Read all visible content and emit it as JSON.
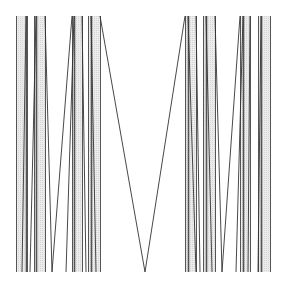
{
  "figure": {
    "width": 284,
    "height": 286,
    "background": "#ffffff",
    "stripe_fill": "#e4e4e4",
    "edge_color": "#555555",
    "line_color": "#333333",
    "top": 16,
    "bottom": 272,
    "stripes": [
      {
        "x": 16,
        "w": 10
      },
      {
        "x": 34,
        "w": 11
      },
      {
        "x": 72,
        "w": 10
      },
      {
        "x": 88,
        "w": 12
      },
      {
        "x": 185,
        "w": 11
      },
      {
        "x": 203,
        "w": 12
      },
      {
        "x": 240,
        "w": 10
      },
      {
        "x": 258,
        "w": 12
      }
    ],
    "edges": [
      16,
      26,
      27,
      34,
      36,
      45,
      72,
      74,
      82,
      88,
      91,
      100,
      185,
      188,
      196,
      203,
      206,
      215,
      240,
      243,
      250,
      258,
      261,
      270
    ],
    "zigzags": [
      [
        [
          26,
          16
        ],
        [
          22,
          272
        ]
      ],
      [
        [
          36,
          16
        ],
        [
          30,
          272
        ]
      ],
      [
        [
          45,
          16
        ],
        [
          52,
          272
        ]
      ],
      [
        [
          52,
          272
        ],
        [
          72,
          16
        ]
      ],
      [
        [
          66,
          272
        ],
        [
          74,
          16
        ]
      ],
      [
        [
          82,
          16
        ],
        [
          86,
          272
        ]
      ],
      [
        [
          91,
          16
        ],
        [
          96,
          272
        ]
      ],
      [
        [
          100,
          16
        ],
        [
          145,
          272
        ]
      ],
      [
        [
          145,
          272
        ],
        [
          185,
          16
        ]
      ],
      [
        [
          188,
          16
        ],
        [
          196,
          272
        ]
      ],
      [
        [
          196,
          16
        ],
        [
          200,
          272
        ]
      ],
      [
        [
          206,
          16
        ],
        [
          212,
          272
        ]
      ],
      [
        [
          215,
          16
        ],
        [
          222,
          272
        ]
      ],
      [
        [
          222,
          272
        ],
        [
          240,
          16
        ]
      ],
      [
        [
          243,
          16
        ],
        [
          236,
          272
        ]
      ],
      [
        [
          250,
          16
        ],
        [
          248,
          272
        ]
      ],
      [
        [
          261,
          16
        ],
        [
          258,
          272
        ]
      ]
    ]
  }
}
